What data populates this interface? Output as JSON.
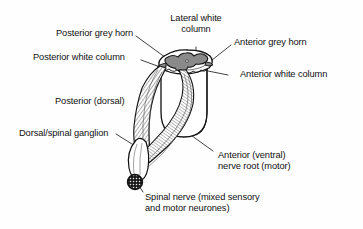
{
  "figure": {
    "type": "anatomical-diagram",
    "background_color": "#fefefe",
    "line_color": "#111111",
    "grey_matter_color": "#8a8a8a",
    "white_matter_color": "#ffffff"
  },
  "labels": {
    "posterior_grey_horn": "Posterior grey horn",
    "lateral_white_column_line1": "Lateral white",
    "lateral_white_column_line2": "column",
    "anterior_grey_horn": "Anterior grey horn",
    "posterior_white_column": "Posterior white column",
    "anterior_white_column": "Anterior white column",
    "posterior_dorsal": "Posterior (dorsal)",
    "dorsal_spinal_ganglion": "Dorsal/spinal ganglion",
    "anterior_ventral_line1": "Anterior (ventral)",
    "anterior_ventral_line2": "nerve root (motor)",
    "spinal_nerve_line1": "Spinal nerve (mixed sensory",
    "spinal_nerve_line2": "and motor neurones)"
  },
  "parts": {
    "spinal_cord_cylinder": "spinal-cord-cylinder",
    "grey_matter_butterfly": "grey-matter-butterfly",
    "dorsal_root_fibres": "dorsal-root-fibres",
    "ventral_root_fibres": "ventral-root-fibres",
    "ganglion_swelling": "ganglion-swelling",
    "spinal_nerve_cut_end": "spinal-nerve-cut-end"
  }
}
